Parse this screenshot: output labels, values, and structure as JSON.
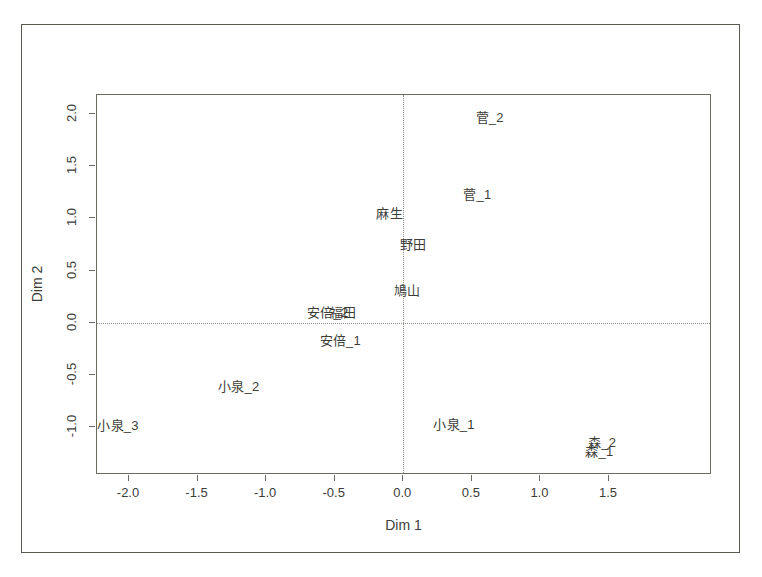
{
  "chart_data": {
    "type": "scatter",
    "title": "",
    "xlabel": "Dim 1",
    "ylabel": "Dim 2",
    "xlim": [
      -2.25,
      1.6
    ],
    "ylim": [
      -1.3,
      2.15
    ],
    "xticks": [
      "-2.0",
      "-1.5",
      "-1.0",
      "-0.5",
      "0.0",
      "0.5",
      "1.0",
      "1.5"
    ],
    "xtick_values": [
      -2.0,
      -1.5,
      -1.0,
      -0.5,
      0.0,
      0.5,
      1.0,
      1.5
    ],
    "yticks": [
      "2.0",
      "1.5",
      "1.0",
      "0.5",
      "0.0",
      "-0.5",
      "-1.0"
    ],
    "ytick_values": [
      2.0,
      1.5,
      1.0,
      0.5,
      0.0,
      -0.5,
      -1.0
    ],
    "grid": false,
    "legend": "none",
    "reference_lines": {
      "vertical_x": 0.0,
      "horizontal_y": 0.0,
      "style": "dotted"
    },
    "marker_style": "text-label-only",
    "points": [
      {
        "label": "菅_2",
        "x": 0.63,
        "y": 1.97
      },
      {
        "label": "菅_1",
        "x": 0.54,
        "y": 1.23
      },
      {
        "label": "麻生",
        "x": -0.1,
        "y": 1.05
      },
      {
        "label": "野田",
        "x": 0.07,
        "y": 0.75
      },
      {
        "label": "鳩山",
        "x": 0.03,
        "y": 0.31
      },
      {
        "label": "安倍_2",
        "x": -0.55,
        "y": 0.1
      },
      {
        "label": "福田",
        "x": -0.44,
        "y": 0.1
      },
      {
        "label": "安倍_1",
        "x": -0.46,
        "y": -0.17
      },
      {
        "label": "小泉_2",
        "x": -1.2,
        "y": -0.61
      },
      {
        "label": "小泉_3",
        "x": -2.08,
        "y": -0.98
      },
      {
        "label": "小泉_1",
        "x": 0.37,
        "y": -0.97
      },
      {
        "label": "森_2",
        "x": 1.45,
        "y": -1.14
      },
      {
        "label": "森_1",
        "x": 1.43,
        "y": -1.23
      }
    ]
  },
  "colors": {
    "text": "#3d3d38",
    "axis": "#6b6b63",
    "frame": "#5a5a52",
    "reference_line": "#8f8f86",
    "background": "#ffffff"
  }
}
